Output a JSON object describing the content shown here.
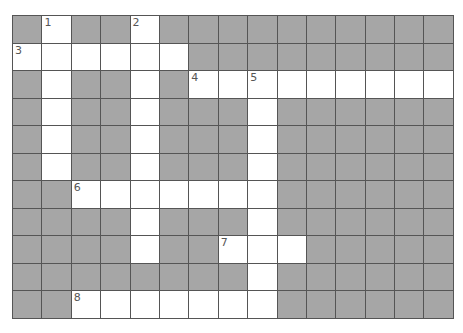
{
  "puzzle": {
    "rows": 11,
    "cols": 15,
    "colors": {
      "block": "#a6a6a6",
      "open": "#ffffff",
      "line": "#555555",
      "number": "#555555"
    },
    "open_cells": [
      [
        0,
        1
      ],
      [
        0,
        4
      ],
      [
        1,
        0
      ],
      [
        1,
        1
      ],
      [
        1,
        2
      ],
      [
        1,
        3
      ],
      [
        1,
        4
      ],
      [
        1,
        5
      ],
      [
        2,
        1
      ],
      [
        2,
        4
      ],
      [
        2,
        6
      ],
      [
        2,
        7
      ],
      [
        2,
        8
      ],
      [
        2,
        9
      ],
      [
        2,
        10
      ],
      [
        2,
        11
      ],
      [
        2,
        12
      ],
      [
        2,
        13
      ],
      [
        2,
        14
      ],
      [
        3,
        1
      ],
      [
        3,
        4
      ],
      [
        3,
        8
      ],
      [
        4,
        1
      ],
      [
        4,
        4
      ],
      [
        4,
        8
      ],
      [
        5,
        1
      ],
      [
        5,
        4
      ],
      [
        5,
        8
      ],
      [
        6,
        2
      ],
      [
        6,
        3
      ],
      [
        6,
        4
      ],
      [
        6,
        5
      ],
      [
        6,
        6
      ],
      [
        6,
        7
      ],
      [
        6,
        8
      ],
      [
        7,
        4
      ],
      [
        7,
        8
      ],
      [
        8,
        4
      ],
      [
        8,
        7
      ],
      [
        8,
        8
      ],
      [
        8,
        9
      ],
      [
        9,
        8
      ],
      [
        10,
        8
      ],
      [
        11,
        0
      ]
    ],
    "numbers": [
      {
        "row": 0,
        "col": 1,
        "label": "1"
      },
      {
        "row": 0,
        "col": 4,
        "label": "2"
      },
      {
        "row": 1,
        "col": 0,
        "label": "3"
      },
      {
        "row": 2,
        "col": 6,
        "label": "4"
      },
      {
        "row": 2,
        "col": 8,
        "label": "5"
      },
      {
        "row": 6,
        "col": 2,
        "label": "6"
      },
      {
        "row": 8,
        "col": 7,
        "label": "7"
      },
      {
        "row": 10,
        "col": 2,
        "label": "8"
      }
    ],
    "extra_open": [
      [
        10,
        2
      ],
      [
        10,
        3
      ],
      [
        10,
        4
      ],
      [
        10,
        5
      ],
      [
        10,
        6
      ],
      [
        10,
        7
      ]
    ]
  }
}
